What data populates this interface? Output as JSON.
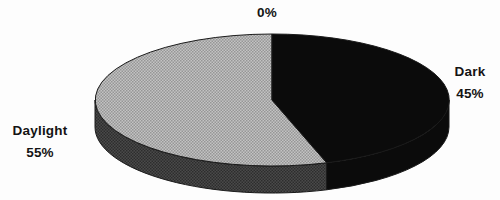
{
  "chart_data": {
    "type": "pie",
    "style": "3d-pie-with-depth",
    "title": "",
    "legend": "none",
    "start_at": "12-oclock",
    "direction": "clockwise",
    "slices": [
      {
        "label": "",
        "display_label": "0%",
        "value": 0,
        "color": "none-zero-width-slice"
      },
      {
        "label": "Dark",
        "display_label": "Dark 45%",
        "value": 45,
        "color": "#0b0b0b"
      },
      {
        "label": "Daylight",
        "display_label": "Daylight 55%",
        "value": 55,
        "color": "#b1b1b1-halftone"
      }
    ]
  },
  "labels": {
    "zero": "0%",
    "dark_name": "Dark",
    "dark_value": "45%",
    "daylight_name": "Daylight",
    "daylight_value": "55%"
  },
  "colors": {
    "dark_slice": "#0b0b0b",
    "daylight_top_light": "#c3c3c3",
    "daylight_top_dot": "#969696",
    "daylight_rim_base": "#4a4a4a",
    "daylight_rim_dot": "#2d2d2d",
    "outline": "#1a1a1a",
    "text": "#141414",
    "background": "#fdfdfd"
  }
}
